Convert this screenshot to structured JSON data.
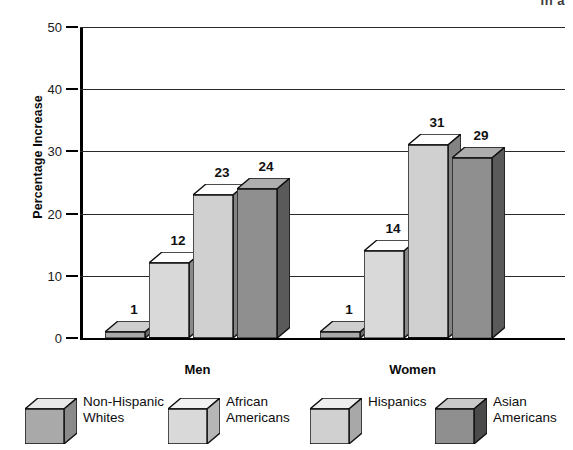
{
  "top_fragment": "in a",
  "chart_data": {
    "type": "bar",
    "title": "",
    "subtitle": "",
    "xlabel": "",
    "ylabel": "Percentage Increase",
    "ylim": [
      0,
      50
    ],
    "ytick_labels": [
      "0",
      "10",
      "20",
      "30",
      "40",
      "50"
    ],
    "ytick_values": [
      0,
      10,
      20,
      30,
      40,
      50
    ],
    "grid": true,
    "legend_position": "bottom",
    "categories": [
      "Men",
      "Women"
    ],
    "series": [
      {
        "name": "Non-Hispanic Whites",
        "values": [
          1,
          1
        ],
        "color": "#a9a9a9"
      },
      {
        "name": "African Americans",
        "values": [
          12,
          14
        ],
        "color": "#d9d9d9"
      },
      {
        "name": "Hispanics",
        "values": [
          23,
          31
        ],
        "color": "#d0d0d0"
      },
      {
        "name": "Asian Americans",
        "values": [
          24,
          29
        ],
        "color": "#8f8f8f"
      }
    ],
    "data_labels": {
      "Men": [
        "1",
        "12",
        "23",
        "24"
      ],
      "Women": [
        "1",
        "14",
        "31",
        "29"
      ]
    }
  },
  "axis": {
    "ticks": [
      {
        "label": "50",
        "value": 50
      },
      {
        "label": "40",
        "value": 40
      },
      {
        "label": "30",
        "value": 30
      },
      {
        "label": "20",
        "value": 20
      },
      {
        "label": "10",
        "value": 10
      },
      {
        "label": "0",
        "value": 0
      }
    ]
  },
  "groups": [
    {
      "label": "Men"
    },
    {
      "label": "Women"
    }
  ],
  "legend": {
    "items": [
      {
        "label": "Non-Hispanic\nWhites",
        "swatch": "legend-cube-non-hispanic-whites",
        "front": "#a9a9a9",
        "top": "#e8e8e8",
        "side": "#8a8a8a"
      },
      {
        "label": "African\nAmericans",
        "swatch": "legend-cube-african-americans",
        "front": "#d9d9d9",
        "top": "#f2f2f2",
        "side": "#b6b6b6"
      },
      {
        "label": "Hispanics",
        "swatch": "legend-cube-hispanics",
        "front": "#d0d0d0",
        "top": "#eeeeee",
        "side": "#a8a8a8"
      },
      {
        "label": "Asian\nAmericans",
        "swatch": "legend-cube-asian-americans",
        "front": "#8f8f8f",
        "top": "#c9c9c9",
        "side": "#4a4a4a"
      }
    ]
  }
}
